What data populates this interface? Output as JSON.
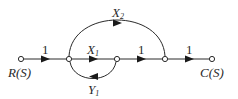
{
  "diagram": {
    "type": "signal-flow-graph",
    "nodes": [
      {
        "id": "R",
        "label": "R(S)"
      },
      {
        "id": "n2",
        "label": ""
      },
      {
        "id": "n3",
        "label": ""
      },
      {
        "id": "n4",
        "label": ""
      },
      {
        "id": "C",
        "label": "C(S)"
      }
    ],
    "branches": [
      {
        "from": "R",
        "to": "n2",
        "gain": "1"
      },
      {
        "from": "n2",
        "to": "n3",
        "gain": "X",
        "sub": "1"
      },
      {
        "from": "n3",
        "to": "n4",
        "gain": "1"
      },
      {
        "from": "n4",
        "to": "C",
        "gain": "1"
      },
      {
        "from": "n2",
        "to": "n4",
        "gain": "X",
        "sub": "2"
      },
      {
        "from": "n3",
        "to": "n2",
        "gain": "Y",
        "sub": "1"
      }
    ],
    "colors": {
      "line": "#2a2a2a",
      "background": "#ffffff"
    }
  }
}
